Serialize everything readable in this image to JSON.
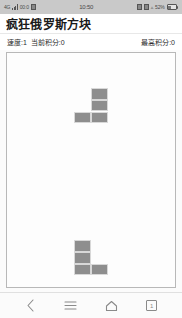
{
  "status_bar": {
    "carrier": "4G",
    "network_label": "00:0",
    "time": "10:50",
    "battery_percent": "52%",
    "icons": [
      "signal-bars-icon",
      "sim-card-icon",
      "alarm-icon",
      "bluetooth-icon",
      "wifi-icon",
      "battery-icon"
    ]
  },
  "app": {
    "title": "疯狂俄罗斯方块"
  },
  "scoreboard": {
    "speed_label": "速度:1",
    "current_score_label": "当前积分:0",
    "high_score_label": "最高积分:0"
  },
  "board": {
    "columns": 10,
    "rows": 20,
    "cell_color": "#8e8e8e",
    "border_color": "#b8b8b8",
    "falling_piece": {
      "name": "J-tetromino",
      "cells": [
        [
          5,
          3
        ],
        [
          5,
          4
        ],
        [
          5,
          5
        ],
        [
          4,
          5
        ]
      ]
    },
    "settled_pieces": [
      {
        "name": "L-tetromino",
        "cells": [
          [
            4,
            16
          ],
          [
            4,
            17
          ],
          [
            5,
            18
          ],
          [
            4,
            18
          ]
        ]
      }
    ]
  },
  "nav_bar": {
    "back_label": "back-button",
    "menu_label": "menu-button",
    "home_label": "home-button",
    "recents_count": "1"
  }
}
